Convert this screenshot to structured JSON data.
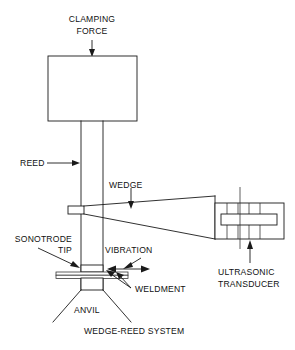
{
  "figure": {
    "title": "WEDGE-REED SYSTEM",
    "type": "technical-line-diagram",
    "background_color": "#ffffff",
    "line_color": "#1a1a1a",
    "text_color": "#111111"
  },
  "labels": {
    "clamping_force_line1": "CLAMPING",
    "clamping_force_line2": "FORCE",
    "reed": "REED",
    "wedge": "WEDGE",
    "sonotrode_line1": "SONOTRODE",
    "sonotrode_line2": "TIP",
    "vibration": "VIBRATION",
    "weldment": "WELDMENT",
    "anvil": "ANVIL",
    "ultrasonic_line1": "ULTRASONIC",
    "ultrasonic_line2": "TRANSDUCER",
    "system_caption": "WEDGE-REED SYSTEM"
  },
  "components": [
    {
      "name": "clamping-mass-block",
      "shape": "rectangle",
      "x": 48,
      "y": 56,
      "width": 89,
      "height": 65
    },
    {
      "name": "reed-column",
      "shape": "vertical-bar",
      "left_x": 81,
      "right_x": 103,
      "top_y": 121,
      "bottom_y": 290
    },
    {
      "name": "wedge-horn",
      "shape": "tapered-wedge",
      "tip_x": 68,
      "tip_y": 210,
      "base_x": 215,
      "base_y": 196
    },
    {
      "name": "ultrasonic-transducer",
      "shape": "hatched-rectangle",
      "x": 215,
      "y": 203,
      "width": 69,
      "height": 36,
      "hatch_count": 5
    },
    {
      "name": "sonotrode-tip",
      "shape": "small-block",
      "x": 81,
      "y": 266,
      "width": 22,
      "height": 6
    },
    {
      "name": "weldment-strips",
      "shape": "two-thin-sheets",
      "left_x": 56,
      "right_x": 128,
      "y": 272
    },
    {
      "name": "anvil",
      "shape": "splayed-v-support",
      "apex_x": 92,
      "apex_y": 290,
      "spread": 44
    }
  ],
  "annotations": [
    {
      "name": "clamping-force-arrow",
      "direction": "down",
      "target": "clamping-mass-block"
    },
    {
      "name": "reed-arrow",
      "direction": "right",
      "target": "reed-column"
    },
    {
      "name": "wedge-arrow",
      "direction": "down",
      "target": "wedge-horn"
    },
    {
      "name": "sonotrode-leader",
      "direction": "diagonal-down-right",
      "target": "sonotrode-tip"
    },
    {
      "name": "vibration-double-arrow",
      "direction": "horizontal-bidirectional",
      "target": "sonotrode-tip"
    },
    {
      "name": "weldment-leaders",
      "direction": "diagonal-up-left",
      "target": "weldment-strips"
    },
    {
      "name": "ultrasonic-arrow",
      "direction": "up",
      "target": "ultrasonic-transducer"
    }
  ]
}
